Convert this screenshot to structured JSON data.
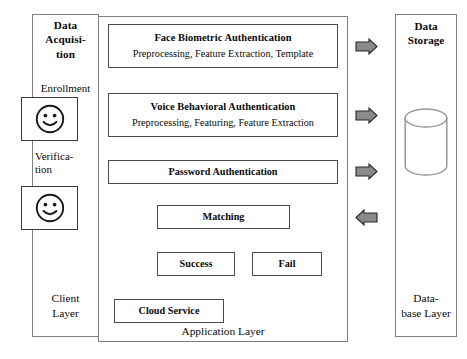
{
  "diagram": {
    "layers": {
      "client": {
        "header": "Data Acquisi-\ntion",
        "header_lines": [
          "Data",
          "Acquisi-",
          "tion"
        ],
        "footer": "Client Layer",
        "footer_lines": [
          "Client",
          "Layer"
        ],
        "inputs": [
          {
            "label": "Enrollment",
            "icon": "smiley-face-icon"
          },
          {
            "label": "Verifica-\ntion",
            "label_lines": [
              "Verifica-",
              "tion"
            ],
            "icon": "smiley-face-icon"
          }
        ]
      },
      "application": {
        "footer": "Application Layer",
        "stages": [
          {
            "id": "face-biometric",
            "title": "Face Biometric Authentication",
            "subtitle": "Preprocessing, Feature Extraction, Template"
          },
          {
            "id": "voice-behavioral",
            "title": "Voice Behavioral Authentication",
            "subtitle": "Preprocessing, Featuring, Feature Extraction"
          },
          {
            "id": "password",
            "title": "Password Authentication",
            "subtitle": ""
          },
          {
            "id": "matching",
            "title": "Matching",
            "subtitle": ""
          },
          {
            "id": "success",
            "title": "Success",
            "subtitle": ""
          },
          {
            "id": "fail",
            "title": "Fail",
            "subtitle": ""
          },
          {
            "id": "cloud-service",
            "title": "Cloud Service",
            "subtitle": ""
          }
        ]
      },
      "database": {
        "header": "Data Storage",
        "header_lines": [
          "Data",
          "Storage"
        ],
        "footer": "Data-base Layer",
        "footer_lines": [
          "Data-",
          "base Layer"
        ],
        "icon": "database-cylinder-icon"
      }
    },
    "connectors": [
      {
        "name": "enrollment-to-voice",
        "direction": "right"
      },
      {
        "name": "verification-to-application",
        "direction": "right"
      },
      {
        "name": "face-to-voice",
        "direction": "down"
      },
      {
        "name": "voice-to-password",
        "direction": "down"
      },
      {
        "name": "password-to-matching",
        "direction": "down"
      },
      {
        "name": "matching-to-success",
        "direction": "down"
      },
      {
        "name": "matching-to-fail",
        "direction": "down"
      },
      {
        "name": "success-to-cloud-service",
        "direction": "down"
      },
      {
        "name": "face-to-storage",
        "direction": "right"
      },
      {
        "name": "voice-to-storage",
        "direction": "right"
      },
      {
        "name": "password-to-storage",
        "direction": "right"
      },
      {
        "name": "storage-to-matching",
        "direction": "left"
      }
    ],
    "colors": {
      "arrow_fill": "#8a8a8a",
      "arrow_stroke": "#262626",
      "box_border": "#4a4a4a",
      "panel_border": "#808080",
      "background": "#ffffff",
      "text": "#0a0a0a"
    }
  }
}
